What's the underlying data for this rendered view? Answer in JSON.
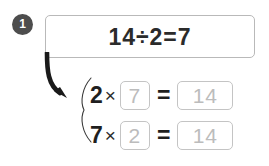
{
  "problem": {
    "number": "1",
    "equation": "14÷2=7"
  },
  "rows": [
    {
      "factor": "2",
      "times_symbol": "×",
      "blank_value": "7",
      "equals_symbol": "=",
      "product_value": "14"
    },
    {
      "factor": "7",
      "times_symbol": "×",
      "blank_value": "2",
      "equals_symbol": "=",
      "product_value": "14"
    }
  ],
  "colors": {
    "badge_fill": "#4d4d4d",
    "badge_text": "#ffffff",
    "equation_text": "#2b2b2b",
    "box_border": "#b9b9b9",
    "answer_border": "#c4c4c4",
    "answer_text": "#bcbcbc",
    "arrow": "#1a1a1a",
    "background": "#ffffff"
  },
  "icons": {
    "arrow": "curved-down-right-arrow-icon",
    "brace": "left-curly-brace-icon"
  }
}
